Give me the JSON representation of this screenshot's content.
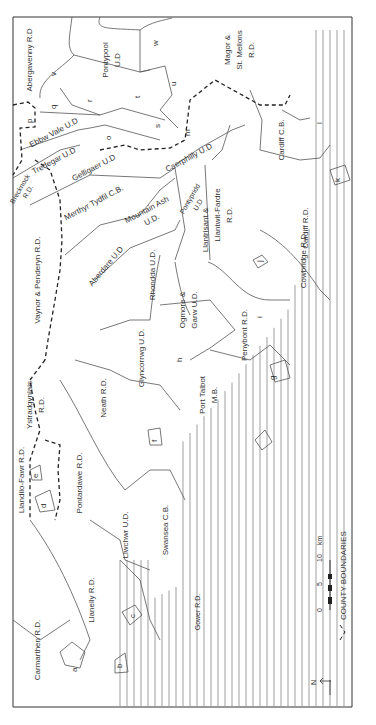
{
  "map": {
    "orientation": "north-left",
    "districts": [
      {
        "key": "abergavenny",
        "label": "Abergavenny R.D."
      },
      {
        "key": "pontypool",
        "label": "Pontypool U.D."
      },
      {
        "key": "magor",
        "label": "Magor & St. Mellons R.D."
      },
      {
        "key": "ebbw",
        "label": "Ebbw Vale U.D."
      },
      {
        "key": "tredegar",
        "label": "Tredegar U.D."
      },
      {
        "key": "gelligaer",
        "label": "Gelligaer U.D."
      },
      {
        "key": "caerphilly",
        "label": "Caerphilly U.D."
      },
      {
        "key": "cardiffcb",
        "label": "Cardiff C.B."
      },
      {
        "key": "cardiffrd",
        "label": "Cardiff R.D."
      },
      {
        "key": "breck",
        "label": "Brecknock R.D."
      },
      {
        "key": "merthyr",
        "label": "Merthyr Tydfil C.B."
      },
      {
        "key": "mountain",
        "label": "Mountain Ash U.D."
      },
      {
        "key": "pontypridd",
        "label": "Pontypridd U.D."
      },
      {
        "key": "llantrisant",
        "label": "Llantrisant & Llantwit-Fardre R.D."
      },
      {
        "key": "aberdare",
        "label": "Aberdare U.D."
      },
      {
        "key": "vaynor",
        "label": "Vaynor & Penderyn R.D."
      },
      {
        "key": "rhondda",
        "label": "Rhondda U.D."
      },
      {
        "key": "ogmore",
        "label": "Ogmore & Garw U.D."
      },
      {
        "key": "cowbridge",
        "label": "Cowbridge R.D."
      },
      {
        "key": "penybont",
        "label": "Penybont R.D."
      },
      {
        "key": "glyncorrwg",
        "label": "Glyncorrwg U.D."
      },
      {
        "key": "ystrad",
        "label": "Ystradgynlais R.D."
      },
      {
        "key": "neath",
        "label": "Neath R.D."
      },
      {
        "key": "porttalbot",
        "label": "Port Talbot M.B."
      },
      {
        "key": "llandilo",
        "label": "Llandilo-Fawr R.D."
      },
      {
        "key": "pontardawe",
        "label": "Pontardawe R.D."
      },
      {
        "key": "llwchwr",
        "label": "Llwchwr U.D."
      },
      {
        "key": "swansea",
        "label": "Swansea C.B."
      },
      {
        "key": "llanelly",
        "label": "Llanelly R.D."
      },
      {
        "key": "carmarthen",
        "label": "Carmarthen R.D."
      },
      {
        "key": "gower",
        "label": "Gower R.D."
      }
    ],
    "text": {
      "abergavenny": "Abergavenny R.D",
      "pontypool_1": "Pontypool",
      "pontypool_2": "U.D",
      "magor_1": "Magor &",
      "magor_2": "St. Mellons",
      "magor_3": "R.D.",
      "ebbw": "Ebbw Vale U.D",
      "tredegar": "Tredegar U.D",
      "gelligaer": "Gelligaer U.D",
      "caerphilly": "Caerphilly U.D",
      "cardiffcb": "Cardiff C.B.",
      "cardiffrd": "Cardiff R.D.",
      "breck_1": "Brecknock",
      "breck_2": "R.D.",
      "merthyr": "Merthyr Tydfil C.B.",
      "mountain_1": "Mountain Ash",
      "mountain_2": "U.D.",
      "pontypridd_1": "Pontypridd",
      "pontypridd_2": "U.D",
      "llantrisant_1": "Llantrisant &",
      "llantrisant_2": "Llantwit-Fardre",
      "llantrisant_3": "R.D.",
      "aberdare": "Aberdare U.D",
      "vaynor": "Vaynor & Penderyn R.D.",
      "rhondda": "Rhondda U.D.",
      "ogmore_1": "Ogmore &",
      "ogmore_2": "Garw U.D.",
      "cowbridge": "Cowbridge R.D.",
      "penybont": "Penybont R.D.",
      "glyncorrwg": "Glyncorrwg U.D.",
      "ystrad_1": "Ystradgynlais",
      "ystrad_2": "R.D.",
      "neath": "Neath R.D.",
      "porttalbot_1": "Port Talbot",
      "porttalbot_2": "M.B.",
      "llandilo": "Llandilo-Fawr R.D.",
      "pontardawe": "Pontardawe R.D.",
      "llwchwr": "Llwchwr U.D.",
      "swansea": "Swansea C.B.",
      "llanelly": "Llanelly R.D.",
      "carmarthen": "Carmarthen R.D.",
      "gower": "Gower R.D."
    },
    "letters": [
      "a",
      "b",
      "c",
      "d",
      "e",
      "f",
      "g",
      "h",
      "i",
      "j",
      "k",
      "l",
      "m",
      "o",
      "p",
      "q",
      "r",
      "s",
      "t",
      "u",
      "v",
      "w"
    ],
    "scale": {
      "ticks": [
        "0",
        "5",
        "10"
      ],
      "unit": "km"
    },
    "north_label": "N",
    "legend_label": "COUNTY BOUNDARIES"
  }
}
